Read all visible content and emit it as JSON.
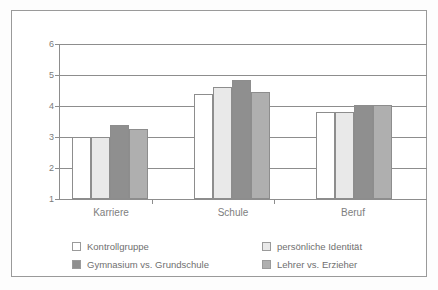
{
  "chart_data": {
    "type": "bar",
    "title": "",
    "subtitle": "",
    "xlabel": "",
    "ylabel": "",
    "categories": [
      "Karriere",
      "Schule",
      "Beruf"
    ],
    "series": [
      {
        "name": "Kontrollgruppe",
        "color": "#ffffff",
        "values": [
          3.0,
          4.4,
          3.8
        ]
      },
      {
        "name": "persönliche Identität",
        "color": "#e9e9e9",
        "values": [
          3.0,
          4.6,
          3.82
        ]
      },
      {
        "name": "Gymnasium vs. Grundschule",
        "color": "#8f8f8f",
        "values": [
          3.4,
          4.85,
          4.02
        ]
      },
      {
        "name": "Lehrer vs. Erzieher",
        "color": "#afafaf",
        "values": [
          3.25,
          4.45,
          4.02
        ]
      }
    ],
    "ylim": [
      1,
      6
    ],
    "yticks": [
      1,
      2,
      3,
      4,
      5,
      6
    ],
    "ytick_labels": [
      "1",
      "2",
      "3",
      "4",
      "5",
      "6"
    ],
    "grid": true,
    "grid_axis": "y",
    "legend_position": "bottom",
    "legend_columns": 2
  },
  "legend": {
    "entries": [
      {
        "label": "Kontrollgruppe",
        "swatch": "#ffffff"
      },
      {
        "label": "Gymnasium vs. Grundschule",
        "swatch": "#8f8f8f"
      },
      {
        "label": "persönliche Identität",
        "swatch": "#e9e9e9"
      },
      {
        "label": "Lehrer vs. Erzieher",
        "swatch": "#afafaf"
      }
    ]
  },
  "axis": {
    "y_labels": [
      "6",
      "5",
      "4",
      "3",
      "2",
      "1"
    ],
    "x_labels": [
      "Karriere",
      "Schule",
      "Beruf"
    ]
  }
}
